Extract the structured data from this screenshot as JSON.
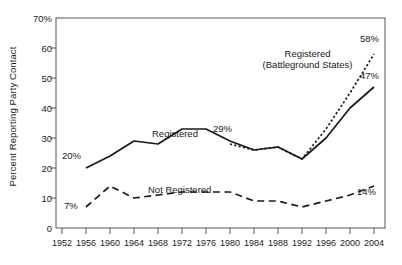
{
  "chart_data": {
    "type": "line",
    "title": "",
    "xlabel": "",
    "ylabel": "Percent Reporting Party Contact",
    "xlim": [
      1952,
      2006
    ],
    "ylim": [
      0,
      70
    ],
    "grid": false,
    "legend_position": "inline-labels",
    "x_ticks": [
      1952,
      1956,
      1960,
      1964,
      1968,
      1972,
      1976,
      1980,
      1984,
      1988,
      1992,
      1996,
      2000,
      2004
    ],
    "y_ticks": [
      0,
      10,
      20,
      30,
      40,
      50,
      60,
      70
    ],
    "y_tick_labels": [
      "0",
      "10",
      "20",
      "30",
      "40",
      "50",
      "60",
      "70%"
    ],
    "series": [
      {
        "name": "Registered",
        "style": "solid",
        "x": [
          1956,
          1960,
          1964,
          1968,
          1972,
          1976,
          1980,
          1984,
          1988,
          1992,
          1996,
          2000,
          2004
        ],
        "values": [
          20,
          24,
          29,
          28,
          33,
          33,
          29,
          26,
          27,
          23,
          30,
          40,
          47
        ]
      },
      {
        "name": "Registered (Battleground States)",
        "style": "dotted",
        "x": [
          1980,
          1984,
          1988,
          1992,
          1996,
          2000,
          2004
        ],
        "values": [
          28,
          26,
          27,
          23,
          33,
          45,
          58
        ]
      },
      {
        "name": "Not Registered",
        "style": "dashed",
        "x": [
          1956,
          1960,
          1964,
          1968,
          1972,
          1976,
          1980,
          1984,
          1988,
          1992,
          1996,
          2000,
          2004
        ],
        "values": [
          7,
          14,
          10,
          11,
          12,
          12,
          12,
          9,
          9,
          7,
          9,
          11,
          14
        ]
      }
    ],
    "annotations": [
      {
        "label": "20%",
        "x": 1954.3,
        "y": 22.5
      },
      {
        "label": "7%",
        "x": 1954.3,
        "y": 9.5
      },
      {
        "label": "29%",
        "x": 1979.0,
        "y": 33.5
      },
      {
        "label": "58%",
        "x": 2004.0,
        "y": 62.5
      },
      {
        "label": "47%",
        "x": 2004.0,
        "y": 51.5
      },
      {
        "label": "14%",
        "x": 2003.0,
        "y": 18.0
      }
    ],
    "series_labels": [
      {
        "text": "Registered",
        "x": 1966.0,
        "y": 38.0
      },
      {
        "text": "Registered\n(Battleground States)",
        "x": 1993.0,
        "y": 57.0
      },
      {
        "text": "Not Registered",
        "x": 1972.0,
        "y": 17.5
      }
    ],
    "colors": {
      "line": "#1a1a1a",
      "axis": "#555555",
      "background": "#ffffff"
    }
  },
  "axis": {
    "y_title": "Percent Reporting Party Contact",
    "y_labels": [
      "70%",
      "60",
      "50",
      "40",
      "30",
      "20",
      "10",
      "0"
    ],
    "x_labels": [
      "1952",
      "1956",
      "1960",
      "1964",
      "1968",
      "1972",
      "1976",
      "1980",
      "1984",
      "1988",
      "1992",
      "1996",
      "2000",
      "2004"
    ]
  },
  "labels": {
    "registered": "Registered",
    "battleground_line1": "Registered",
    "battleground_line2": "(Battleground States)",
    "not_registered": "Not Registered",
    "a_20": "20%",
    "a_7": "7%",
    "a_29": "29%",
    "a_58": "58%",
    "a_47": "47%",
    "a_14": "14%"
  }
}
